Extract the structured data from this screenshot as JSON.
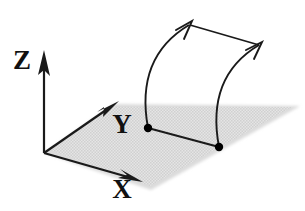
{
  "figure": {
    "background_color": "#ffffff",
    "line_color": "#1a1a1a",
    "plane_fill_color": "#dedede",
    "plane_edge_color": "#c9c9c9",
    "dot_color": "#000000"
  },
  "axes": {
    "origin": {
      "x": 44,
      "y": 153
    },
    "items": [
      {
        "name": "z-axis",
        "label": "Z",
        "label_x": 22,
        "label_y": 63,
        "from": {
          "x": 44,
          "y": 153
        },
        "to": {
          "x": 44,
          "y": 58
        },
        "arrow": "solid-triangle"
      },
      {
        "name": "y-axis",
        "label": "Y",
        "label_x": 122,
        "label_y": 127,
        "from": {
          "x": 44,
          "y": 153
        },
        "to": {
          "x": 115,
          "y": 103
        },
        "arrow": "solid-triangle"
      },
      {
        "name": "x-axis",
        "label": "X",
        "label_x": 122,
        "label_y": 192,
        "from": {
          "x": 44,
          "y": 153
        },
        "to": {
          "x": 139,
          "y": 180
        },
        "arrow": "solid-triangle"
      }
    ]
  },
  "plane": {
    "name": "ground-plane",
    "description": "shaded horizontal XY plane",
    "polygon": "44,153 114,104 300,106 151,190",
    "fill": "#dedede"
  },
  "surface": {
    "name": "curved-ruled-surface",
    "base_points": [
      {
        "name": "base-point-left",
        "x": 148,
        "y": 128
      },
      {
        "name": "base-point-right",
        "x": 219,
        "y": 147
      }
    ],
    "base_edge": {
      "from": {
        "x": 148,
        "y": 128
      },
      "to": {
        "x": 219,
        "y": 147
      }
    },
    "top_edge": {
      "from": {
        "x": 190,
        "y": 24
      },
      "to": {
        "x": 261,
        "y": 44
      }
    },
    "left_curve": {
      "name": "left-generating-curve",
      "path": "M 148 128 C 142 92 146 52 190 24",
      "arrow_tip": {
        "x": 192,
        "y": 22
      },
      "arrow": "open-vee"
    },
    "right_curve": {
      "name": "right-generating-curve",
      "path": "M 219 147 C 213 110 218 70 261 44",
      "arrow_tip": {
        "x": 263,
        "y": 42
      },
      "arrow": "open-vee"
    }
  }
}
